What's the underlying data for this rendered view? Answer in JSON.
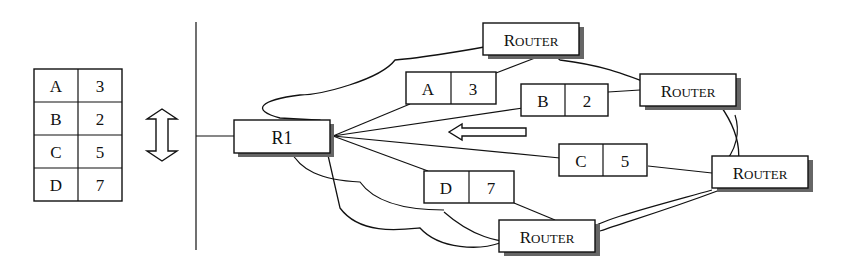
{
  "routing_table": {
    "rows": [
      {
        "dest": "A",
        "cost": "3"
      },
      {
        "dest": "B",
        "cost": "2"
      },
      {
        "dest": "C",
        "cost": "5"
      },
      {
        "dest": "D",
        "cost": "7"
      }
    ]
  },
  "local_router": {
    "label": "R1"
  },
  "advertisements": [
    {
      "dest": "A",
      "cost": "3"
    },
    {
      "dest": "B",
      "cost": "2"
    },
    {
      "dest": "C",
      "cost": "5"
    },
    {
      "dest": "D",
      "cost": "7"
    }
  ],
  "neighbors": [
    {
      "label_first": "R",
      "label_rest": "OUTER"
    },
    {
      "label_first": "R",
      "label_rest": "OUTER"
    },
    {
      "label_first": "R",
      "label_rest": "OUTER"
    },
    {
      "label_first": "R",
      "label_rest": "OUTER"
    }
  ]
}
